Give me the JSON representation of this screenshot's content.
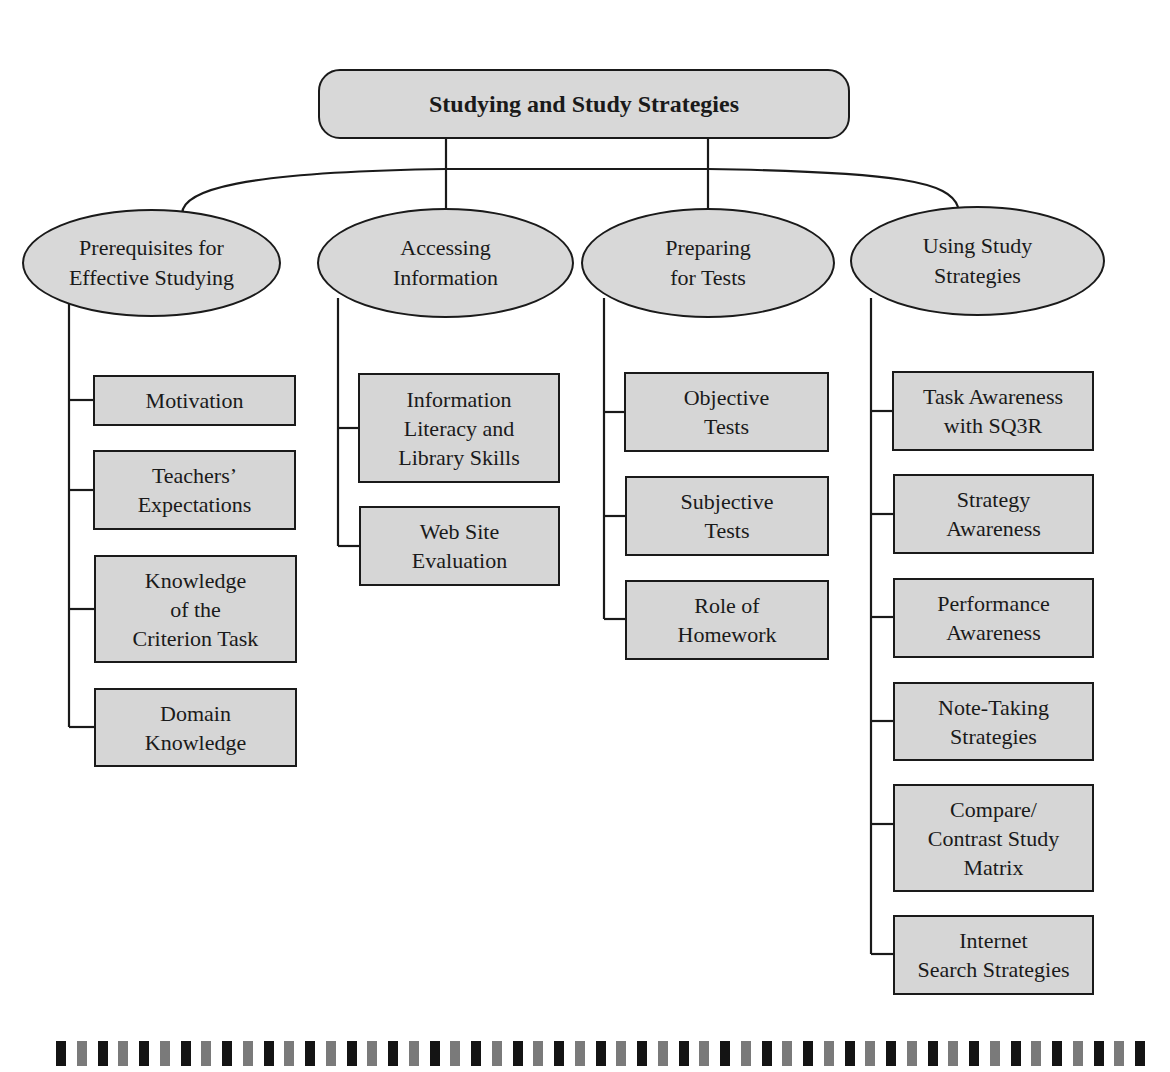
{
  "diagram": {
    "title": "Studying and Study Strategies",
    "branches": [
      {
        "label": "Prerequisites for\nEffective Studying",
        "children": [
          "Motivation",
          "Teachers’\nExpectations",
          "Knowledge\nof the\nCriterion Task",
          "Domain\nKnowledge"
        ]
      },
      {
        "label": "Accessing\nInformation",
        "children": [
          "Information\nLiteracy and\nLibrary Skills",
          "Web Site\nEvaluation"
        ]
      },
      {
        "label": "Preparing\nfor Tests",
        "children": [
          "Objective\nTests",
          "Subjective\nTests",
          "Role of\nHomework"
        ]
      },
      {
        "label": "Using Study\nStrategies",
        "children": [
          "Task Awareness\nwith SQ3R",
          "Strategy\nAwareness",
          "Performance\nAwareness",
          "Note-Taking\nStrategies",
          "Compare/\nContrast Study\nMatrix",
          "Internet\nSearch Strategies"
        ]
      }
    ]
  },
  "colors": {
    "node_fill": "#d8d8d8",
    "stroke": "#1a1a1a",
    "strip_dark": "#141414",
    "strip_gray": "#7a7a7a"
  },
  "decorative_strip": {
    "bar_count": 53
  }
}
